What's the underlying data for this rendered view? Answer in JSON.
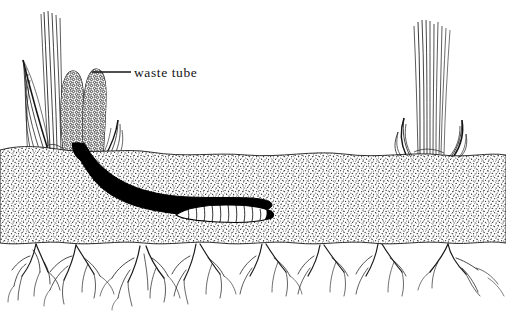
{
  "figure": {
    "background_color": "#ffffff",
    "ink_color": "#141414",
    "style": "pen-and-ink scientific line illustration",
    "width": 506,
    "height": 315
  },
  "annotations": [
    {
      "id": "waste-tube",
      "label": "waste tube",
      "leader_line": {
        "x1": 92,
        "y1": 72,
        "x2": 131,
        "y2": 72
      },
      "text_position": {
        "x": 134,
        "y": 77
      }
    }
  ],
  "elements": {
    "soil_band": {
      "name": "soil band",
      "fill": "#ffffff",
      "texture": "stipple",
      "top_y": 150,
      "bottom_y": 243
    },
    "tunnel": {
      "name": "larval tunnel",
      "fill": "#000000",
      "description": "black burrow descending from waste tube then running horizontally"
    },
    "larva": {
      "name": "larva",
      "fill": "#ffffff",
      "outline": "#000000",
      "segments": 11,
      "position": {
        "x": 210,
        "y": 213
      }
    },
    "waste_tubes": {
      "name": "waste tubes",
      "count": 2,
      "texture": "granular pellets"
    },
    "plant_left": {
      "name": "grass plant",
      "blades": 9
    },
    "plant_right": {
      "name": "grass plant",
      "blades": 12
    },
    "roots": {
      "name": "fibrous root systems",
      "clumps": 5
    }
  }
}
